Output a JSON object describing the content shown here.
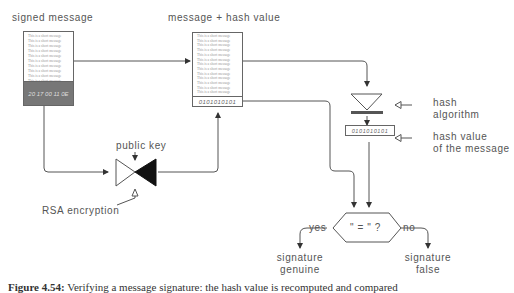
{
  "labels": {
    "signed_message": "signed message",
    "message_hash": "message + hash value",
    "public_key": "public key",
    "rsa_encryption": "RSA encryption",
    "hash_algorithm_1": "hash",
    "hash_algorithm_2": "algorithm",
    "hash_value_1": "hash value",
    "hash_value_2": "of the message",
    "compare": "\" = \" ?",
    "yes": "yes",
    "no": "no",
    "sig_genuine_1": "signature",
    "sig_genuine_2": "genuine",
    "sig_false_1": "signature",
    "sig_false_2": "false"
  },
  "signed_message_box": {
    "lines": [
      "This is a short message",
      "This is a short message",
      "This is a short message",
      "This is a short message",
      "This is a short message",
      "This is a short message",
      "This is a short message",
      "This is a short message",
      "This is a short message",
      "This is a short message"
    ],
    "signature": "20 17 00 11 0E"
  },
  "message_hash_box": {
    "lines": [
      "This is a short message",
      "This is a short message",
      "This is a short message",
      "This is a short message",
      "This is a short message",
      "This is a short message",
      "This is a short message",
      "This is a short message",
      "This is a short message",
      "This is a short message",
      "This is a short message",
      "This is a short message",
      "This is a short message"
    ],
    "hash": "0101010101"
  },
  "computed_hash": "0101010101",
  "caption": {
    "figure": "Figure 4.54:",
    "text": "Verifying a message signature: the hash value is recomputed and compared"
  }
}
